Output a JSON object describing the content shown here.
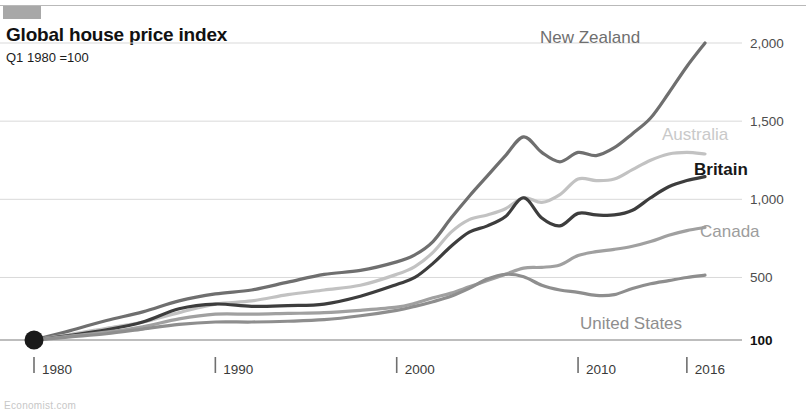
{
  "header": {
    "logo_name": "publication-logo",
    "title": "Global house price index",
    "subtitle": "Q1 1980 =100"
  },
  "footer": {
    "source": "Economist.com"
  },
  "chart_data": {
    "type": "line",
    "title": "Global house price index",
    "subtitle": "Q1 1980 =100",
    "xlabel": "",
    "ylabel": "",
    "xlim": [
      1980,
      2017
    ],
    "ylim": [
      100,
      2100
    ],
    "grid": true,
    "legend_position": "inline-right",
    "x_ticks": [
      1980,
      1990,
      2000,
      2010,
      2016
    ],
    "x_tick_labels": [
      "1980",
      "1990",
      "2000",
      "2010",
      "2016"
    ],
    "y_ticks": [
      100,
      500,
      1000,
      1500,
      2000
    ],
    "y_tick_labels": [
      "100",
      "500",
      "1,000",
      "1,500",
      "2,000"
    ],
    "start_marker": {
      "x": 1980,
      "y": 100,
      "label": "Q1 1980 = 100"
    },
    "series": [
      {
        "name": "New Zealand",
        "color": "#6f6f6f",
        "label_color": "#6f6f6f",
        "label_bold": false,
        "x": [
          1980,
          1982,
          1984,
          1986,
          1988,
          1990,
          1992,
          1994,
          1996,
          1998,
          2000,
          2001,
          2002,
          2003,
          2004,
          2005,
          2006,
          2007,
          2008,
          2009,
          2010,
          2011,
          2012,
          2013,
          2014,
          2015,
          2016,
          2017
        ],
        "values": [
          100,
          160,
          225,
          280,
          350,
          395,
          420,
          470,
          520,
          545,
          600,
          645,
          730,
          880,
          1020,
          1150,
          1280,
          1400,
          1300,
          1240,
          1300,
          1280,
          1330,
          1420,
          1520,
          1680,
          1850,
          2000
        ]
      },
      {
        "name": "Australia",
        "color": "#c2c2c2",
        "label_color": "#c9c9c9",
        "label_bold": false,
        "x": [
          1980,
          1982,
          1984,
          1986,
          1988,
          1990,
          1992,
          1994,
          1996,
          1998,
          2000,
          2001,
          2002,
          2003,
          2004,
          2005,
          2006,
          2007,
          2008,
          2009,
          2010,
          2011,
          2012,
          2013,
          2014,
          2015,
          2016,
          2017
        ],
        "values": [
          100,
          135,
          175,
          215,
          275,
          330,
          350,
          390,
          420,
          450,
          520,
          570,
          660,
          790,
          870,
          900,
          940,
          1010,
          980,
          1030,
          1130,
          1120,
          1130,
          1190,
          1250,
          1290,
          1300,
          1290
        ]
      },
      {
        "name": "Britain",
        "color": "#3d3d3d",
        "label_color": "#181818",
        "label_bold": true,
        "x": [
          1980,
          1982,
          1984,
          1986,
          1988,
          1990,
          1992,
          1994,
          1996,
          1998,
          2000,
          2001,
          2002,
          2003,
          2004,
          2005,
          2006,
          2007,
          2008,
          2009,
          2010,
          2011,
          2012,
          2013,
          2014,
          2015,
          2016,
          2017
        ],
        "values": [
          100,
          130,
          165,
          215,
          300,
          330,
          315,
          320,
          330,
          380,
          455,
          500,
          590,
          700,
          790,
          830,
          890,
          1010,
          880,
          830,
          910,
          900,
          900,
          930,
          1010,
          1080,
          1120,
          1145
        ]
      },
      {
        "name": "Canada",
        "color": "#a0a0a0",
        "label_color": "#9d9d9d",
        "label_bold": false,
        "x": [
          1980,
          1982,
          1984,
          1986,
          1988,
          1990,
          1992,
          1994,
          1996,
          1998,
          2000,
          2001,
          2002,
          2003,
          2004,
          2005,
          2006,
          2007,
          2008,
          2009,
          2010,
          2011,
          2012,
          2013,
          2014,
          2015,
          2016,
          2017
        ],
        "values": [
          100,
          125,
          150,
          185,
          235,
          265,
          265,
          270,
          275,
          290,
          310,
          335,
          370,
          400,
          440,
          480,
          520,
          560,
          565,
          580,
          640,
          665,
          680,
          700,
          730,
          770,
          800,
          820
        ]
      },
      {
        "name": "United States",
        "color": "#8e8e8e",
        "label_color": "#8e8e8e",
        "label_bold": false,
        "x": [
          1980,
          1982,
          1984,
          1986,
          1988,
          1990,
          1992,
          1994,
          1996,
          1998,
          2000,
          2001,
          2002,
          2003,
          2004,
          2005,
          2006,
          2007,
          2008,
          2009,
          2010,
          2011,
          2012,
          2013,
          2014,
          2015,
          2016,
          2017
        ],
        "values": [
          100,
          120,
          140,
          170,
          200,
          215,
          215,
          220,
          230,
          255,
          290,
          315,
          345,
          380,
          430,
          490,
          520,
          505,
          450,
          420,
          405,
          385,
          390,
          430,
          460,
          480,
          500,
          515
        ]
      }
    ],
    "annotations": [
      {
        "name": "New Zealand",
        "x_px": 540,
        "y_px": 43
      },
      {
        "name": "Australia",
        "x_px": 662,
        "y_px": 140
      },
      {
        "name": "Britain",
        "x_px": 694,
        "y_px": 175
      },
      {
        "name": "Canada",
        "x_px": 700,
        "y_px": 237
      },
      {
        "name": "United States",
        "x_px": 580,
        "y_px": 329
      }
    ]
  }
}
